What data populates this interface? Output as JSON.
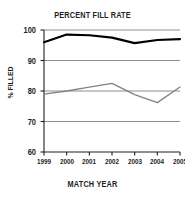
{
  "chart_data": {
    "type": "line",
    "title": "PERCENT FILL RATE",
    "xlabel": "MATCH YEAR",
    "ylabel": "% FILLED",
    "categories": [
      "1999",
      "2000",
      "2001",
      "2002",
      "2003",
      "2004",
      "2005"
    ],
    "x": [
      1999,
      2000,
      2001,
      2002,
      2003,
      2004,
      2005
    ],
    "series": [
      {
        "name": "upper-series",
        "color": "#000000",
        "values": [
          96.0,
          98.5,
          98.3,
          97.5,
          95.7,
          96.7,
          97.0
        ]
      },
      {
        "name": "lower-series",
        "color": "#808285",
        "values": [
          79.0,
          80.0,
          81.3,
          82.5,
          78.8,
          76.2,
          81.3
        ]
      }
    ],
    "ylim": [
      60,
      100
    ],
    "yticks": [
      60,
      70,
      80,
      90,
      100
    ],
    "ytick_labels": [
      "60",
      "70",
      "80",
      "90",
      "100"
    ],
    "grid": true,
    "gridlines": [
      70,
      80,
      90,
      100
    ],
    "legend": null,
    "legend_position": "none",
    "axis_color": "#231f20",
    "grid_color": "#808285",
    "background": "#ffffff"
  }
}
